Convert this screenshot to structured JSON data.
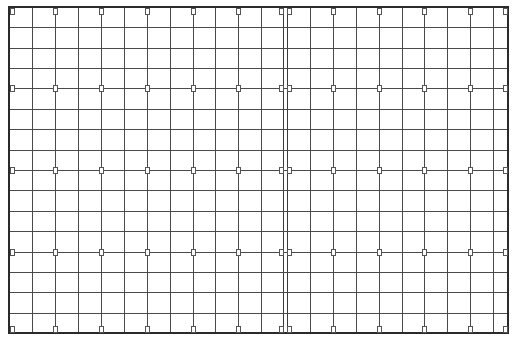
{
  "grid": {
    "border": {
      "x": 9,
      "y": 7,
      "width": 499,
      "height": 326
    },
    "vertical_lines": [
      9,
      32,
      55,
      78,
      101,
      124,
      147,
      170,
      193,
      215,
      238,
      261,
      283,
      287,
      310,
      333,
      356,
      379,
      402,
      424,
      447,
      470,
      493,
      508
    ],
    "horizontal_lines": [
      7,
      27,
      48,
      68,
      88,
      109,
      129,
      150,
      170,
      190,
      211,
      231,
      252,
      272,
      292,
      313,
      333
    ],
    "divider": {
      "x1": 283,
      "x2": 287
    },
    "marker_rows": [
      7,
      88,
      170,
      252,
      333
    ],
    "marker_cols": [
      9,
      55,
      101,
      147,
      193,
      238,
      283,
      287,
      333,
      379,
      424,
      470,
      508
    ],
    "marker_size": {
      "w": 4,
      "h": 6
    },
    "colors": {
      "line": "#4a4a4a",
      "border": "#2a2a2a",
      "background": "#ffffff"
    }
  }
}
